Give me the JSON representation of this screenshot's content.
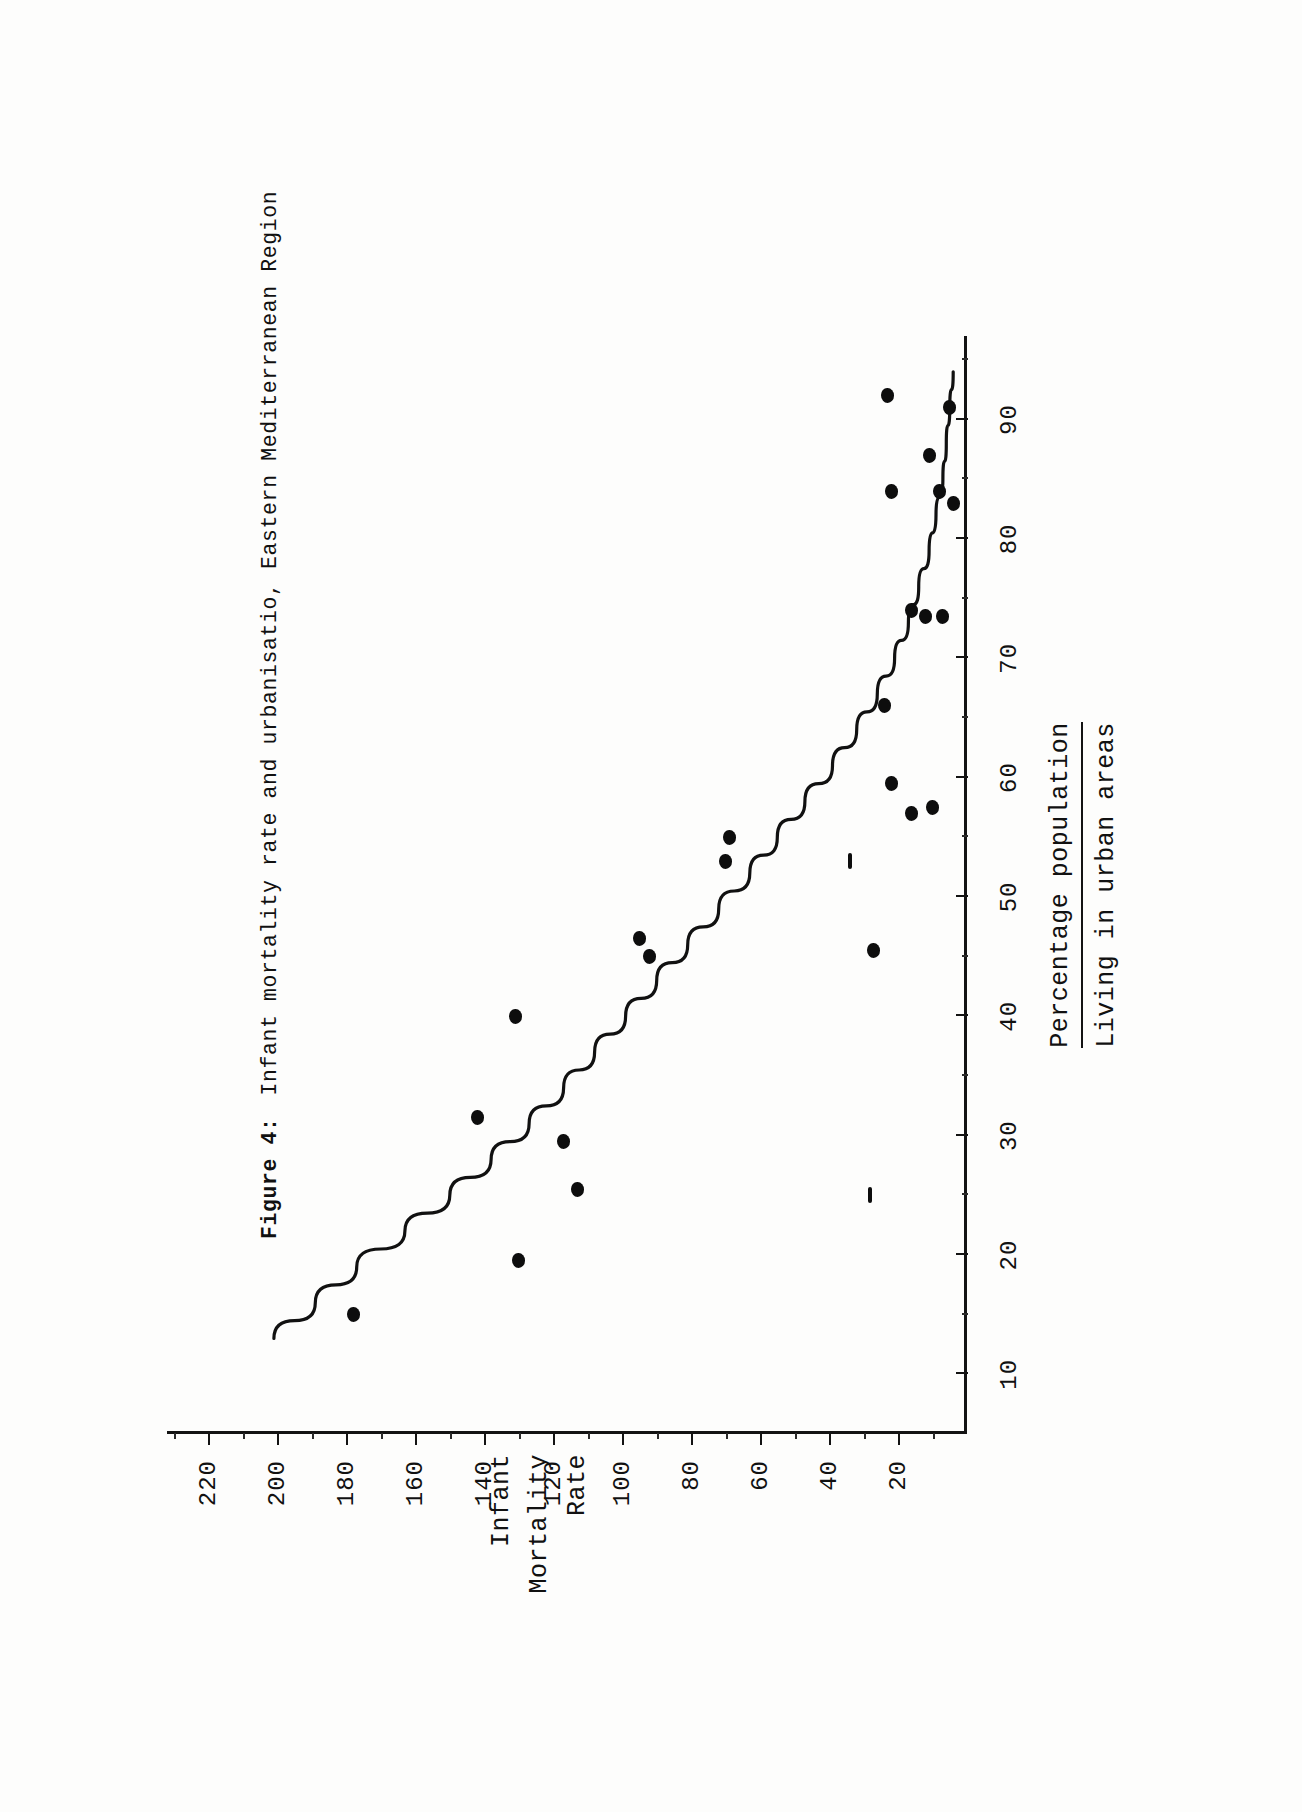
{
  "figure": {
    "number_label": "Figure 4:",
    "caption": "Infant mortality rate and urbanisatio, Eastern Mediterranean Region"
  },
  "axis_titles": {
    "x_line1": "Percentage population",
    "x_line2": "Living in urban areas",
    "y_line1": "Infant",
    "y_line2": "Mortality",
    "y_line3": "Rate"
  },
  "chart_data": {
    "type": "scatter",
    "title": "Infant mortality rate and urbanisatio, Eastern Mediterranean Region",
    "xlabel": "Percentage population Living in urban areas",
    "ylabel": "Infant Mortality Rate",
    "xlim": [
      5,
      97
    ],
    "ylim": [
      0,
      232
    ],
    "grid": false,
    "legend": null,
    "orientation": "page-rotated-90ccw",
    "xtick_labels": [
      "10",
      "20",
      "30",
      "40",
      "50",
      "60",
      "70",
      "80",
      "90"
    ],
    "xticks": [
      10,
      20,
      30,
      40,
      50,
      60,
      70,
      80,
      90
    ],
    "ytick_labels": [
      "20",
      "40",
      "60",
      "80",
      "100",
      "120",
      "140",
      "160",
      "180",
      "200",
      "220"
    ],
    "yticks": [
      20,
      40,
      60,
      80,
      100,
      120,
      140,
      160,
      180,
      200,
      220
    ],
    "points": [
      {
        "x": 15,
        "y": 178,
        "marker": "dot"
      },
      {
        "x": 19.5,
        "y": 130,
        "marker": "dot"
      },
      {
        "x": 25.5,
        "y": 113,
        "marker": "dot"
      },
      {
        "x": 25,
        "y": 28,
        "marker": "dash"
      },
      {
        "x": 29.5,
        "y": 117,
        "marker": "dot"
      },
      {
        "x": 31.5,
        "y": 142,
        "marker": "dot"
      },
      {
        "x": 40,
        "y": 131,
        "marker": "dot"
      },
      {
        "x": 45,
        "y": 92,
        "marker": "dot"
      },
      {
        "x": 45.5,
        "y": 27,
        "marker": "dot"
      },
      {
        "x": 46.5,
        "y": 95,
        "marker": "dot"
      },
      {
        "x": 53,
        "y": 70,
        "marker": "dot"
      },
      {
        "x": 53,
        "y": 34,
        "marker": "dash"
      },
      {
        "x": 55,
        "y": 69,
        "marker": "dot"
      },
      {
        "x": 57,
        "y": 16,
        "marker": "dot"
      },
      {
        "x": 57.5,
        "y": 10,
        "marker": "dot"
      },
      {
        "x": 59.5,
        "y": 22,
        "marker": "dot"
      },
      {
        "x": 66,
        "y": 24,
        "marker": "dot"
      },
      {
        "x": 73.5,
        "y": 12,
        "marker": "dot"
      },
      {
        "x": 73.5,
        "y": 7,
        "marker": "dot"
      },
      {
        "x": 74,
        "y": 16,
        "marker": "dot"
      },
      {
        "x": 84,
        "y": 22,
        "marker": "dot"
      },
      {
        "x": 84,
        "y": 8,
        "marker": "dot"
      },
      {
        "x": 83,
        "y": 4,
        "marker": "dot"
      },
      {
        "x": 87,
        "y": 11,
        "marker": "dot"
      },
      {
        "x": 92,
        "y": 23,
        "marker": "dot"
      },
      {
        "x": 91,
        "y": 5,
        "marker": "dot"
      }
    ],
    "fitted_curve": {
      "style": "solid, dash-broken near the left tail",
      "points": [
        {
          "x": 13,
          "y": 201
        },
        {
          "x": 16,
          "y": 189
        },
        {
          "x": 19,
          "y": 177
        },
        {
          "x": 22,
          "y": 163
        },
        {
          "x": 25,
          "y": 150
        },
        {
          "x": 28,
          "y": 138
        },
        {
          "x": 31,
          "y": 127
        },
        {
          "x": 34,
          "y": 117
        },
        {
          "x": 37,
          "y": 108
        },
        {
          "x": 40,
          "y": 99
        },
        {
          "x": 43,
          "y": 90
        },
        {
          "x": 46,
          "y": 81
        },
        {
          "x": 49,
          "y": 72
        },
        {
          "x": 52,
          "y": 63
        },
        {
          "x": 55,
          "y": 55
        },
        {
          "x": 58,
          "y": 47
        },
        {
          "x": 61,
          "y": 39
        },
        {
          "x": 64,
          "y": 32
        },
        {
          "x": 67,
          "y": 26
        },
        {
          "x": 70,
          "y": 21
        },
        {
          "x": 73,
          "y": 17
        },
        {
          "x": 76,
          "y": 14
        },
        {
          "x": 79,
          "y": 11
        },
        {
          "x": 82,
          "y": 9
        },
        {
          "x": 85,
          "y": 7
        },
        {
          "x": 88,
          "y": 6
        },
        {
          "x": 91,
          "y": 5
        },
        {
          "x": 94,
          "y": 4
        }
      ]
    }
  }
}
